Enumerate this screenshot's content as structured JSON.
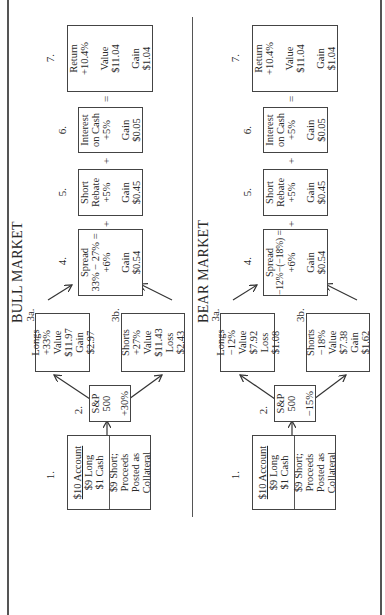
{
  "sections": {
    "bull": {
      "title": "BULL MARKET",
      "step1": {
        "num": "1.",
        "line1": "$10 Account",
        "line2": "$9 Long",
        "line3": "$1 Cash",
        "line4": "$9 Short;",
        "line5": "Proceeds",
        "line6": "Posted as",
        "line7": "Collateral"
      },
      "step2": {
        "num": "2.",
        "line1": "S&P",
        "line2": "500",
        "line3": "+30%"
      },
      "step3a": {
        "num": "3a.",
        "line1": "Longs",
        "line2": "+33%",
        "line3": "Value",
        "line4": "$11.97",
        "line5": "Gain",
        "line6": "$2.97"
      },
      "step3b": {
        "num": "3b.",
        "line1": "Shorts",
        "line2": "+27%",
        "line3": "Value",
        "line4": "$11.43",
        "line5": "Loss",
        "line6": "$2.43"
      },
      "step4": {
        "num": "4.",
        "line1": "Spread",
        "line2": "33% − 27% =",
        "line3": "+6%",
        "line4": "Gain",
        "line5": "$0.54"
      },
      "step5": {
        "num": "5.",
        "line1": "Short",
        "line2": "Rebate",
        "line3": "+5%",
        "line4": "Gain",
        "line5": "$0.45"
      },
      "step6": {
        "num": "6.",
        "line1": "Interest",
        "line2": "on Cash",
        "line3": "+5%",
        "line4": "Gain",
        "line5": "$0.05"
      },
      "step7": {
        "num": "7.",
        "line1": "Return",
        "line2": "+10.4%",
        "line3": "Value",
        "line4": "$11.04",
        "line5": "Gain",
        "line6": "$1.04"
      },
      "op_plus_1": "+",
      "op_plus_2": "+",
      "op_equals": "="
    },
    "bear": {
      "title": "BEAR MARKET",
      "step1": {
        "num": "1.",
        "line1": "$10 Account",
        "line2": "$9 Long",
        "line3": "$1 Cash",
        "line4": "$9 Short;",
        "line5": "Proceeds",
        "line6": "Posted as",
        "line7": "Collateral"
      },
      "step2": {
        "num": "2.",
        "line1": "S&P",
        "line2": "500",
        "line3": "−15%"
      },
      "step3a": {
        "num": "3a.",
        "line1": "Longs",
        "line2": "−12%",
        "line3": "Value",
        "line4": "$7.92",
        "line5": "Loss",
        "line6": "$1.08"
      },
      "step3b": {
        "num": "3b.",
        "line1": "Shorts",
        "line2": "−18%",
        "line3": "Value",
        "line4": "$7.38",
        "line5": "Gain",
        "line6": "$1.62"
      },
      "step4": {
        "num": "4.",
        "line1": "Spread",
        "line2": "−12%−(−18%) =",
        "line3": "+6%",
        "line4": "Gain",
        "line5": "$0.54"
      },
      "step5": {
        "num": "5.",
        "line1": "Short",
        "line2": "Rebate",
        "line3": "+5%",
        "line4": "Gain",
        "line5": "$0.45"
      },
      "step6": {
        "num": "6.",
        "line1": "Interest",
        "line2": "on Cash",
        "line3": "+5%",
        "line4": "Gain",
        "line5": "$0.05"
      },
      "step7": {
        "num": "7.",
        "line1": "Return",
        "line2": "+10.4%",
        "line3": "Value",
        "line4": "$11.04",
        "line5": "Gain",
        "line6": "$1.04"
      },
      "op_plus_1": "+",
      "op_plus_2": "+",
      "op_equals": "="
    }
  },
  "colors": {
    "line": "#444444",
    "text": "#2a2a2a",
    "background": "#ffffff"
  }
}
